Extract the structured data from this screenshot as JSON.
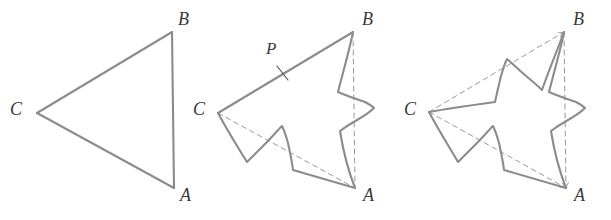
{
  "figure": {
    "background_color": "#ffffff",
    "stroke_color": "#8c8c8c",
    "dash_color": "#9a9a9a",
    "label_color": "#3b3b3b",
    "stroke_width": 2.1,
    "dash_width": 1,
    "dash_pattern": "5 4",
    "panels": [
      {
        "name": "panel-stage-0",
        "caption": "",
        "vertices": [
          {
            "key": "B",
            "label": "B",
            "x": 172,
            "y": 32,
            "label_x": 178,
            "label_y": 10
          },
          {
            "key": "C",
            "label": "C",
            "x": 37,
            "y": 113,
            "label_x": 10,
            "label_y": 100
          },
          {
            "key": "A",
            "label": "A",
            "x": 174,
            "y": 188,
            "label_x": 180,
            "label_y": 186
          }
        ],
        "solid_paths": [
          "M 37 113 L 172 32",
          "M 172 32 L 174 188",
          "M 37 113 L 174 188"
        ],
        "dashed_paths": [],
        "tick_marks": [],
        "point_labels": []
      },
      {
        "name": "panel-stage-1",
        "caption": "",
        "vertices": [
          {
            "key": "B",
            "label": "B",
            "x": 353,
            "y": 32,
            "label_x": 362,
            "label_y": 10
          },
          {
            "key": "C",
            "label": "C",
            "x": 218,
            "y": 113,
            "label_x": 193,
            "label_y": 100
          },
          {
            "key": "A",
            "label": "A",
            "x": 355,
            "y": 188,
            "label_x": 363,
            "label_y": 186
          }
        ],
        "solid_paths": [
          "M 218 113 L 353 32",
          "M 353 32 C 349 52 343 72 338 92 C 347 96 356 99 365 102 C 369 104 372 106 374 108 C 370 112 364 116 357 120 C 350 124 344 128 340 131 C 343 150 348 170 355 188",
          "M 355 188 C 334 182 313 176 293 170 C 292 161 290 152 288 143 C 286 136 284 130 282 126 C 277 131 271 138 264 145 C 257 152 251 158 247 162 C 237 146 227 130 218 113"
        ],
        "dashed_paths": [
          "M 353 32 L 355 188",
          "M 218 113 L 355 188"
        ],
        "tick_marks": [
          "M 277 66 L 288 80"
        ],
        "point_labels": [
          {
            "key": "P",
            "label": "P",
            "label_x": 266,
            "label_y": 40
          }
        ]
      },
      {
        "name": "panel-stage-2",
        "caption": "",
        "vertices": [
          {
            "key": "B",
            "label": "B",
            "x": 564,
            "y": 32,
            "label_x": 573,
            "label_y": 10
          },
          {
            "key": "C",
            "label": "C",
            "x": 429,
            "y": 112,
            "label_x": 404,
            "label_y": 100
          },
          {
            "key": "A",
            "label": "A",
            "x": 566,
            "y": 188,
            "label_x": 574,
            "label_y": 186
          }
        ],
        "solid_paths": [
          "M 429 112 C 451 108 473 105 495 102 C 497 93 499 84 501 76 C 503 69 505 63 507 59 C 512 63 518 69 525 75 C 532 81 538 86 542 90 C 549 70 557 51 564 32",
          "M 564 32 C 560 52 554 72 549 92 C 558 96 567 99 576 102 C 580 104 583 106 585 108 C 581 112 575 116 568 120 C 561 124 555 128 551 131 C 554 150 559 170 566 188",
          "M 566 188 C 545 182 524 176 504 170 C 503 161 501 152 499 143 C 497 136 495 130 493 126 C 488 131 482 138 475 145 C 468 152 462 158 458 162 C 448 145 438 129 429 112"
        ],
        "dashed_paths": [
          "M 429 112 L 564 32",
          "M 564 32 L 566 188",
          "M 429 112 L 566 188"
        ],
        "tick_marks": [],
        "point_labels": []
      }
    ]
  }
}
